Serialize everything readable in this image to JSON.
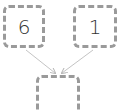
{
  "diagram": {
    "inputs": [
      {
        "value": "6"
      },
      {
        "value": "1"
      }
    ],
    "result": {
      "value": ""
    },
    "colors": {
      "border": "#9a9a9a",
      "arrow": "#b8b8b8",
      "text": "#333333"
    }
  }
}
